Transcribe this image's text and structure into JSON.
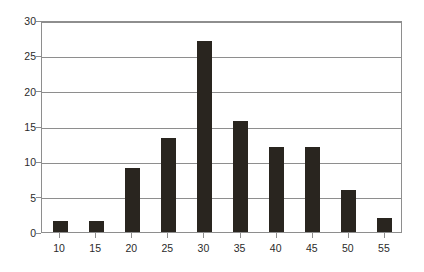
{
  "chart_data": {
    "type": "bar",
    "title": "",
    "subtitle": "",
    "xlabel": "",
    "ylabel": "",
    "categories": [
      "10",
      "15",
      "20",
      "25",
      "30",
      "35",
      "40",
      "45",
      "50",
      "55"
    ],
    "values": [
      1.5,
      1.5,
      9,
      13.3,
      27,
      15.7,
      12,
      12,
      6,
      2
    ],
    "series": [
      {
        "name": "Frequency",
        "values": [
          1.5,
          1.5,
          9,
          13.3,
          27,
          15.7,
          12,
          12,
          6,
          2
        ]
      }
    ],
    "ylim": [
      0,
      30
    ],
    "ytick_labels": [
      "0",
      "5",
      "10",
      "15",
      "20",
      "25",
      "30"
    ],
    "ytick_values": [
      0,
      5,
      10,
      15,
      20,
      25,
      30
    ],
    "xtick_labels": [
      "10",
      "15",
      "20",
      "25",
      "30",
      "35",
      "40",
      "45",
      "50",
      "55"
    ],
    "grid": "horizontal",
    "legend": "none",
    "bar_color": "#29251f",
    "axis_color": "#8e8e8e",
    "background_color": "#ffffff",
    "annotations": []
  }
}
